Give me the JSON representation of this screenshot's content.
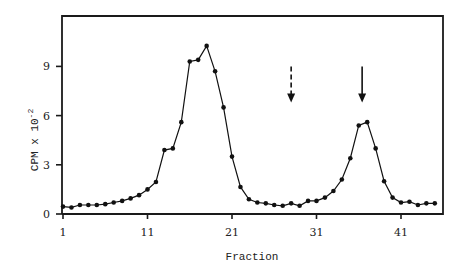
{
  "chart_data": {
    "type": "line",
    "title": "",
    "xlabel": "Fraction",
    "ylabel": "CPM x 10^-2",
    "ylabel_main": "CPM x 10",
    "ylabel_exp": "-2",
    "xlim": [
      1,
      45
    ],
    "ylim": [
      0,
      12
    ],
    "x_ticks": [
      1,
      11,
      21,
      31,
      41
    ],
    "y_ticks": [
      0,
      3,
      6,
      9
    ],
    "grid": false,
    "legend": null,
    "series": [
      {
        "name": "CPM",
        "marker": "circle",
        "x": [
          1,
          2,
          3,
          4,
          5,
          6,
          7,
          8,
          9,
          10,
          11,
          12,
          13,
          14,
          15,
          16,
          17,
          18,
          19,
          20,
          21,
          22,
          23,
          24,
          25,
          26,
          27,
          28,
          29,
          30,
          31,
          32,
          33,
          34,
          35,
          36,
          37,
          38,
          39,
          40,
          41,
          42,
          43,
          44,
          45
        ],
        "values": [
          0.45,
          0.4,
          0.55,
          0.55,
          0.55,
          0.6,
          0.7,
          0.8,
          0.95,
          1.15,
          1.5,
          1.95,
          3.9,
          4.0,
          5.6,
          9.3,
          9.4,
          10.25,
          8.7,
          6.5,
          3.5,
          1.65,
          0.9,
          0.7,
          0.65,
          0.55,
          0.5,
          0.65,
          0.5,
          0.8,
          0.8,
          1.0,
          1.4,
          2.1,
          3.4,
          5.4,
          5.6,
          4.0,
          2.0,
          1.0,
          0.7,
          0.75,
          0.55,
          0.65,
          0.65
        ]
      }
    ],
    "annotations": [
      {
        "type": "arrow",
        "style": "dashed",
        "x": 28,
        "y_from": 9.0,
        "y_to": 6.8
      },
      {
        "type": "arrow",
        "style": "solid",
        "x": 36.4,
        "y_from": 9.0,
        "y_to": 6.8
      }
    ]
  }
}
